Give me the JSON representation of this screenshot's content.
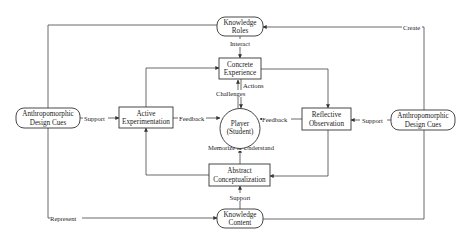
{
  "diagram": {
    "type": "kolb-learning-cycle-flowchart",
    "nodes": {
      "knowledge_roles": {
        "lines": [
          "Knowledge",
          "Roles"
        ],
        "shape": "rounded"
      },
      "concrete_experience": {
        "lines": [
          "Concrete",
          "Experience"
        ],
        "shape": "rect"
      },
      "player": {
        "lines": [
          "Player",
          "(Student)"
        ],
        "shape": "circle"
      },
      "abstract_conceptualization": {
        "lines": [
          "Abstract",
          "Conceptualization"
        ],
        "shape": "rect"
      },
      "knowledge_content": {
        "lines": [
          "Knowledge",
          "Content"
        ],
        "shape": "rounded"
      },
      "active_experimentation": {
        "lines": [
          "Active",
          "Experimentation"
        ],
        "shape": "rect"
      },
      "reflective_observation": {
        "lines": [
          "Reflective",
          "Observation"
        ],
        "shape": "rect"
      },
      "adc_left": {
        "lines": [
          "Anthropomorphic",
          "Design Cues"
        ],
        "shape": "rounded"
      },
      "adc_right": {
        "lines": [
          "Anthropomorphic",
          "Design Cues"
        ],
        "shape": "rounded"
      }
    },
    "edges": [
      {
        "from": "knowledge_roles",
        "to": "concrete_experience",
        "label": "Interact"
      },
      {
        "from": "concrete_experience",
        "to": "player",
        "label": "Actions"
      },
      {
        "from": "player",
        "to": "concrete_experience",
        "label": "Challenges"
      },
      {
        "from": "active_experimentation",
        "to": "player",
        "label": "Feedback"
      },
      {
        "from": "reflective_observation",
        "to": "player",
        "label": "Feedback"
      },
      {
        "from": "abstract_conceptualization",
        "to": "player",
        "label": "Memorize & Understand"
      },
      {
        "from": "knowledge_content",
        "to": "abstract_conceptualization",
        "label": "Support"
      },
      {
        "from": "adc_left",
        "to": "active_experimentation",
        "label": "Support"
      },
      {
        "from": "adc_right",
        "to": "reflective_observation",
        "label": "Support"
      },
      {
        "from": "adc_right",
        "to": "knowledge_roles",
        "label": "Create"
      },
      {
        "from": "adc_left",
        "to": "knowledge_content",
        "label": "Represent"
      },
      {
        "from": "adc_left",
        "to": "knowledge_roles",
        "label": ""
      },
      {
        "from": "knowledge_content",
        "to": "adc_right",
        "label": ""
      },
      {
        "from": "active_experimentation",
        "to": "concrete_experience",
        "label": ""
      },
      {
        "from": "concrete_experience",
        "to": "reflective_observation",
        "label": ""
      },
      {
        "from": "reflective_observation",
        "to": "abstract_conceptualization",
        "label": ""
      },
      {
        "from": "abstract_conceptualization",
        "to": "active_experimentation",
        "label": ""
      }
    ]
  }
}
